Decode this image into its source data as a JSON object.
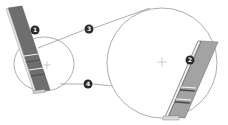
{
  "diagram": {
    "colors": {
      "outline": "#8a8a8a",
      "panel_fill": "#7a7a7a",
      "panel_fill_light": "#a8a8a8",
      "callout_fill": "#2a2a2a",
      "callout_text": "#ffffff",
      "background": "#ffffff"
    },
    "callouts": [
      {
        "id": 1,
        "label": "1",
        "x": 35,
        "y": 30
      },
      {
        "id": 2,
        "label": "2",
        "x": 190,
        "y": 60
      },
      {
        "id": 3,
        "label": "3",
        "x": 89,
        "y": 29
      },
      {
        "id": 4,
        "label": "4",
        "x": 88,
        "y": 83
      }
    ],
    "small_circle": {
      "cx": 44,
      "cy": 64,
      "rx": 30,
      "ry": 26
    },
    "large_circle": {
      "cx": 162,
      "cy": 62,
      "rx": 54,
      "ry": 56
    },
    "crosshairs": [
      {
        "name": "small-center-crosshair",
        "x": 47,
        "y": 65
      },
      {
        "name": "large-center-crosshair",
        "x": 162,
        "y": 62
      }
    ]
  }
}
